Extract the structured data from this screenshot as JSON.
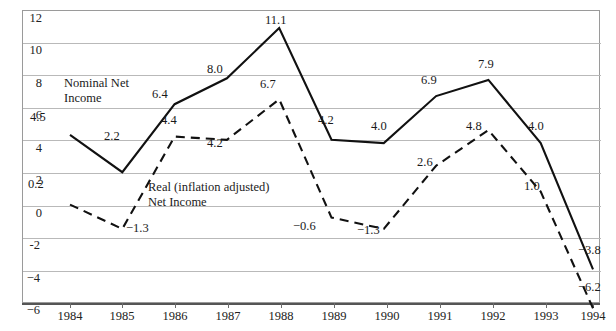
{
  "title": "",
  "chart_data": {
    "type": "line",
    "title": "",
    "subtitle": "",
    "xlabel": "",
    "ylabel": "",
    "x": [
      "1984",
      "1985",
      "1986",
      "1987",
      "1988",
      "1989",
      "1990",
      "1991",
      "1992",
      "1993",
      "1994"
    ],
    "categories": [
      "1984",
      "1985",
      "1986",
      "1987",
      "1988",
      "1989",
      "1990",
      "1991",
      "1992",
      "1993",
      "1994"
    ],
    "ylim": [
      -6,
      12
    ],
    "yticks": [
      "12",
      "10",
      "8",
      "6",
      "4",
      "2",
      "0",
      "-2",
      "-4",
      "-6"
    ],
    "ytick_values": [
      12,
      10,
      8,
      6,
      4,
      2,
      0,
      -2,
      -4,
      -6
    ],
    "grid": true,
    "legend_position": "inline-annotation",
    "series": [
      {
        "name": "Nominal Net Income",
        "style": "solid",
        "color": "#111111",
        "values": [
          4.5,
          2.2,
          6.4,
          8.0,
          11.1,
          4.2,
          4.0,
          6.9,
          7.9,
          4.0,
          -3.8
        ],
        "labels": [
          "4.5",
          "2.2",
          "6.4",
          "8.0",
          "11.1",
          "4.2",
          "4.0",
          "6.9",
          "7.9",
          "4.0",
          "−3.8"
        ]
      },
      {
        "name": "Real (inflation adjusted) Net Income",
        "style": "dashed",
        "color": "#111111",
        "values": [
          0.2,
          -1.3,
          4.4,
          4.2,
          6.7,
          -0.6,
          -1.3,
          2.6,
          4.8,
          1.0,
          -6.2
        ],
        "labels": [
          "0.2",
          "−1.3",
          "4.4",
          "4.2",
          "6.7",
          "−0.6",
          "−1.3",
          "2.6",
          "4.8",
          "1.0",
          "−6.2"
        ]
      }
    ],
    "annotations": [
      {
        "name": "nominal-series-label",
        "text_line1": "Nominal Net",
        "text_line2": "Income"
      },
      {
        "name": "real-series-label",
        "text_line1": "Real (inflation adjusted)",
        "text_line2": "Net Income"
      }
    ]
  },
  "legend": {
    "nominal_line1": "Nominal Net",
    "nominal_line2": "Income",
    "real_line1": "Real (inflation adjusted)",
    "real_line2": "Net Income"
  },
  "point_labels": {
    "nominal": {
      "y1984": "4.5",
      "y1985": "2.2",
      "y1986": "6.4",
      "y1987": "8.0",
      "y1988": "11.1",
      "y1989": "4.2",
      "y1990": "4.0",
      "y1991": "6.9",
      "y1992": "7.9",
      "y1993": "4.0",
      "y1994": "−3.8"
    },
    "real": {
      "y1984": "0.2",
      "y1985": "−1.3",
      "y1986": "4.4",
      "y1987": "4.2",
      "y1988": "6.7",
      "y1989": "−0.6",
      "y1990": "−1.3",
      "y1991": "2.6",
      "y1992": "4.8",
      "y1993": "1.0",
      "y1994": "−6.2"
    }
  },
  "axis": {
    "y": {
      "t12": "12",
      "t10": "10",
      "t8": "8",
      "t6": "6",
      "t4": "4",
      "t2": "2",
      "t0": "0",
      "tm2": "-2",
      "tm4": "−4",
      "tm6": "−6"
    },
    "x": {
      "x1984": "1984",
      "x1985": "1985",
      "x1986": "1986",
      "x1987": "1987",
      "x1988": "1988",
      "x1989": "1989",
      "x1990": "1990",
      "x1991": "1991",
      "x1992": "1992",
      "x1993": "1993",
      "x1994": "1994"
    }
  }
}
